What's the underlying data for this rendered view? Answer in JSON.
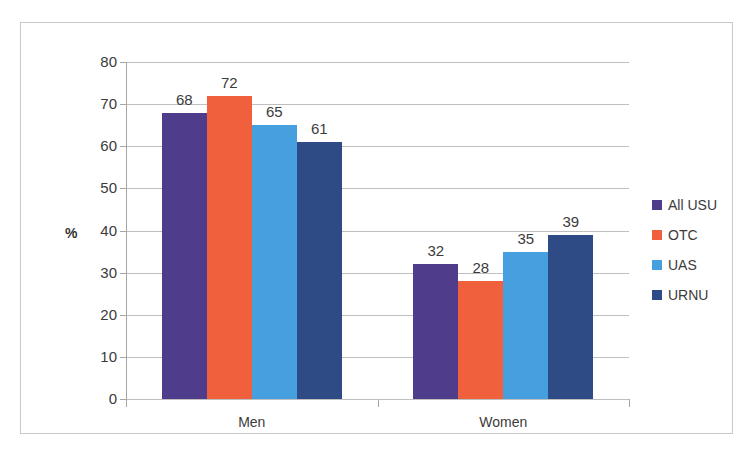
{
  "chart_data": {
    "type": "bar",
    "title": "",
    "subtitle": "",
    "xlabel": "",
    "ylabel": "%",
    "categories": [
      "Men",
      "Women"
    ],
    "series": [
      {
        "name": "All USU",
        "color": "#4F3D8C",
        "values": [
          68,
          32
        ]
      },
      {
        "name": "OTC",
        "color": "#F1603C",
        "values": [
          72,
          28
        ]
      },
      {
        "name": "UAS",
        "color": "#46A0E0",
        "values": [
          65,
          35
        ]
      },
      {
        "name": "URNU",
        "color": "#2F4B85",
        "values": [
          61,
          39
        ]
      }
    ],
    "ylim": [
      0,
      80
    ],
    "ytick_step": 10,
    "yticks": [
      "0",
      "10",
      "20",
      "30",
      "40",
      "50",
      "60",
      "70",
      "80"
    ],
    "grid": true,
    "legend_position": "right",
    "data_labels": true
  }
}
